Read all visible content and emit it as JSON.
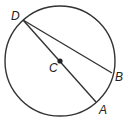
{
  "diagram": {
    "type": "circle-geometry",
    "circle": {
      "center_label": "C",
      "cx": 60,
      "cy": 61,
      "r": 55
    },
    "points": [
      {
        "label": "D",
        "x": 23,
        "y": 20,
        "label_x": 11,
        "label_y": 20
      },
      {
        "label": "C",
        "x": 60,
        "y": 61,
        "label_x": 49,
        "label_y": 72
      },
      {
        "label": "B",
        "x": 112,
        "y": 73,
        "label_x": 115,
        "label_y": 81
      },
      {
        "label": "A",
        "x": 96,
        "y": 102,
        "label_x": 99,
        "label_y": 114
      }
    ],
    "segments": [
      {
        "from": "D",
        "to": "A",
        "kind": "diameter"
      },
      {
        "from": "D",
        "to": "B",
        "kind": "chord"
      }
    ],
    "colors": {
      "stroke": "#333333",
      "background": "#ffffff"
    }
  }
}
